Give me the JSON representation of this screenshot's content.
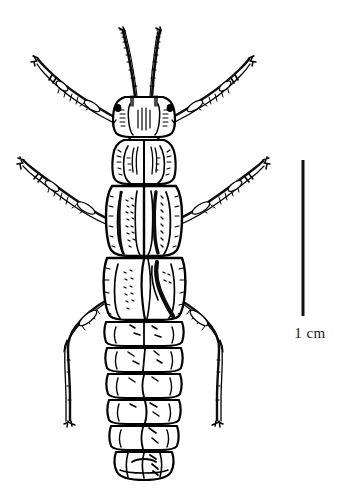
{
  "figure": {
    "illustration_style": "black-ink-line-drawing",
    "background_color": "#ffffff",
    "ink_color": "#000000",
    "width_px": 337,
    "height_px": 494
  },
  "scale_bar": {
    "label": "1 cm",
    "orientation": "vertical",
    "color": "#111111",
    "x_px": 303,
    "top_px": 160,
    "bottom_px": 316,
    "length_px": 156,
    "thickness_px": 3
  },
  "specimen": {
    "name": "aquatic insect nymph",
    "view": "dorsal",
    "parts": {
      "antennae": "two long segmented antennae",
      "head": "head capsule with paired compound eyes",
      "pronotum": "pronotum segment",
      "wing_pads": "paired mesothoracic and metathoracic wing pads",
      "abdomen": "ten segmented abdominal tergites",
      "legs": "three pairs of legs: prothoracic, mesothoracic, metathoracic",
      "cerci": "terminal abdominal segments"
    }
  }
}
